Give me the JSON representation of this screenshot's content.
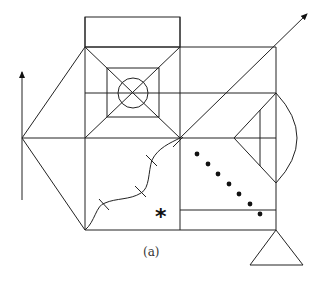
{
  "figure": {
    "caption": "(a)",
    "asterisk": "*",
    "stroke_color": "#222222",
    "background": "#ffffff",
    "elements": {
      "left_arrow": "vertical arrow pointing up",
      "diagonal_arrow": "arrow pointing up-right",
      "center_square_with_circle": "inner square with inscribed circle and diagonals",
      "right_triangle_with_arc": "triangle with arc on right edge",
      "dot_sequence_count": 7,
      "wavy_line_ticks": 4,
      "bottom_triangle": "triangle hanging below right column"
    }
  }
}
